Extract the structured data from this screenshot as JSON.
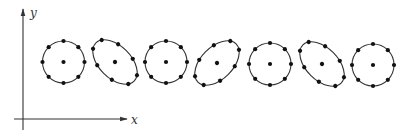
{
  "axes": {
    "origin": [
      23,
      119
    ],
    "x_axis": {
      "start": [
        14,
        119
      ],
      "end": [
        127,
        119
      ],
      "label": "x",
      "label_pos": [
        131,
        124
      ]
    },
    "y_axis": {
      "start": [
        23,
        130
      ],
      "end": [
        23,
        9
      ],
      "label": "y",
      "label_pos": [
        30,
        17
      ]
    }
  },
  "colors": {
    "stroke": "#333333",
    "point": "#111111",
    "background": "#ffffff"
  },
  "shapes": [
    {
      "id": "circle-1",
      "type": "circle",
      "cx": 63.5,
      "cy": 62,
      "rx": 21,
      "ry": 21,
      "rotation": 0
    },
    {
      "id": "ellipse-2",
      "type": "ellipse",
      "cx": 115,
      "cy": 62,
      "rx": 27,
      "ry": 16,
      "rotation": 45
    },
    {
      "id": "circle-3",
      "type": "circle",
      "cx": 166,
      "cy": 62,
      "rx": 21,
      "ry": 21,
      "rotation": 0
    },
    {
      "id": "ellipse-4",
      "type": "ellipse",
      "cx": 217,
      "cy": 63,
      "rx": 27,
      "ry": 16,
      "rotation": -45
    },
    {
      "id": "circle-5",
      "type": "circle",
      "cx": 270,
      "cy": 64,
      "rx": 21,
      "ry": 21,
      "rotation": 0
    },
    {
      "id": "ellipse-6",
      "type": "ellipse",
      "cx": 322,
      "cy": 64,
      "rx": 27,
      "ry": 16,
      "rotation": 45
    },
    {
      "id": "circle-7",
      "type": "circle",
      "cx": 373,
      "cy": 65,
      "rx": 21,
      "ry": 21,
      "rotation": 0
    }
  ],
  "points_per_shape": 8,
  "point_radius": 2.1
}
